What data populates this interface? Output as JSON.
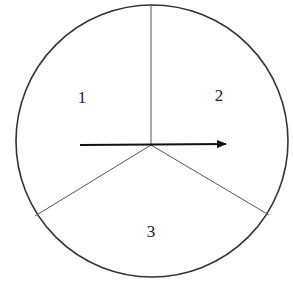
{
  "diagram": {
    "type": "circle-divided-into-three-sectors",
    "circle": {
      "cx": 152,
      "cy": 141,
      "r": 136,
      "stroke": "#333333"
    },
    "center": {
      "x": 151,
      "y": 145
    },
    "dividers": [
      {
        "x2": 151,
        "y2": 5
      },
      {
        "x2": 35,
        "y2": 216
      },
      {
        "x2": 269,
        "y2": 215
      }
    ],
    "sectors": [
      {
        "label": "1",
        "x": 82,
        "y": 103
      },
      {
        "label": "2",
        "x": 219,
        "y": 101
      },
      {
        "label": "3",
        "x": 151,
        "y": 237
      }
    ],
    "arrow": {
      "x1": 80,
      "y1": 145,
      "x2": 226,
      "y2": 144,
      "color": "#111111"
    }
  }
}
